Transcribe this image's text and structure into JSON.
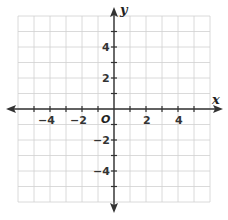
{
  "figure": {
    "type": "coordinate-plane",
    "x_axis_label": "x",
    "y_axis_label": "y",
    "origin_label": "O",
    "x_range": [
      -6,
      6
    ],
    "y_range": [
      -6,
      6
    ],
    "grid_step": 1,
    "x_tick_labels": [
      "−4",
      "−2",
      "2",
      "4"
    ],
    "y_tick_labels": [
      "4",
      "2",
      "−2",
      "−4"
    ],
    "colors": {
      "grid": "#d0d0d0",
      "axis": "#333333"
    }
  }
}
